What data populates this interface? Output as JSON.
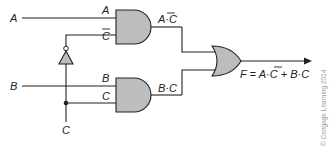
{
  "diagram": {
    "inputs": {
      "a": "A",
      "b": "B",
      "c": "C"
    },
    "and_gate_1": {
      "input_top": "A",
      "input_bottom": "C",
      "input_bottom_overbar": true,
      "output": "A·C̄",
      "output_left": "A·",
      "output_right": "C"
    },
    "and_gate_2": {
      "input_top": "B",
      "input_bottom": "C",
      "output": "B·C"
    },
    "not_gate": {
      "input": "C",
      "output": "C̄"
    },
    "or_gate": {
      "inputs": [
        "A·C̄",
        "B·C"
      ],
      "output": "F"
    },
    "equation": {
      "lhs": "F = A·",
      "cbar": "C",
      "rhs": " + B·C",
      "full": "F = A·C̄ + B·C"
    },
    "copyright": "© Cengage Learning 2014",
    "colors": {
      "gate_fill": "#bdbdbd",
      "line": "#222222",
      "copyright": "#999999"
    }
  }
}
